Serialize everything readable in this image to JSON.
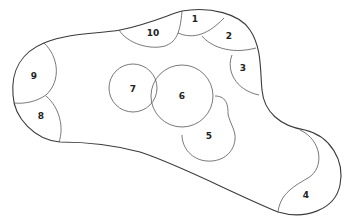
{
  "diagram": {
    "type": "numbered-region-map",
    "stroke_color": "#3a3a3a",
    "background": "#ffffff",
    "edge_regions": [
      {
        "id": "1",
        "label": "1"
      },
      {
        "id": "2",
        "label": "2"
      },
      {
        "id": "3",
        "label": "3"
      },
      {
        "id": "4",
        "label": "4"
      },
      {
        "id": "8",
        "label": "8"
      },
      {
        "id": "9",
        "label": "9"
      },
      {
        "id": "10",
        "label": "10"
      }
    ],
    "inner_circles": [
      {
        "id": "5",
        "label": "5"
      },
      {
        "id": "6",
        "label": "6"
      },
      {
        "id": "7",
        "label": "7"
      }
    ]
  },
  "labels": {
    "r1": "1",
    "r2": "2",
    "r3": "3",
    "r4": "4",
    "r5": "5",
    "r6": "6",
    "r7": "7",
    "r8": "8",
    "r9": "9",
    "r10": "10"
  }
}
